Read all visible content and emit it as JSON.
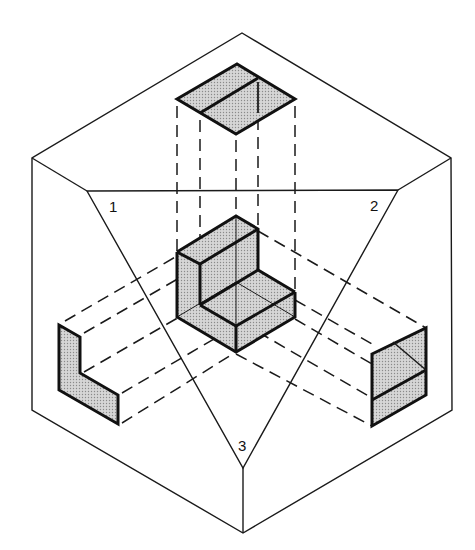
{
  "figure": {
    "type": "orthographic projection in glass-box (isometric) view",
    "plane_labels": [
      "1",
      "2",
      "3"
    ],
    "colors": {
      "line": "#111111",
      "shade": "#c8c8c8",
      "background": "#ffffff"
    }
  },
  "labels": {
    "plane_1": "1",
    "plane_2": "2",
    "plane_3": "3"
  },
  "views": {
    "top_view": "shaded rhombus projected on top plane",
    "left_view": "shaded L-shape projected on left plane",
    "right_view": "shaded parallelogram with dividing line projected on right plane",
    "object": "shaded isometric L-shaped block at center"
  }
}
